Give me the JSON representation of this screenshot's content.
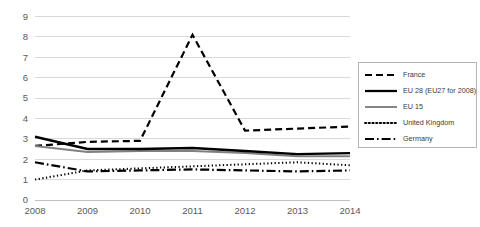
{
  "chart_data": {
    "type": "line",
    "title": "",
    "xlabel": "",
    "ylabel": "",
    "categories": [
      "2008",
      "2009",
      "2010",
      "2011",
      "2012",
      "2013",
      "2014"
    ],
    "x": [
      2008,
      2009,
      2010,
      2011,
      2012,
      2013,
      2014
    ],
    "ylim": [
      0,
      10
    ],
    "xlim": [
      2008,
      2014
    ],
    "grid": true,
    "gridlines": "horizontal",
    "legend_position": "right",
    "y_ticks": [
      "0",
      "1",
      "2",
      "3",
      "4",
      "5",
      "6",
      "7",
      "8",
      "9",
      "10"
    ],
    "y_tick_values": [
      0,
      1,
      2,
      3,
      4,
      5,
      6,
      7,
      8,
      9,
      10
    ],
    "x_ticks": [
      "2008",
      "2009",
      "2010",
      "2011",
      "2012",
      "2013",
      "2014"
    ],
    "series": [
      {
        "name": "France",
        "style": "dashed",
        "color": "#000000",
        "width": 2.2,
        "dash": "7,4",
        "values": [
          2.65,
          2.85,
          2.9,
          8.1,
          3.4,
          3.5,
          3.6
        ]
      },
      {
        "name": "EU 28 (EU27 for 2008)",
        "style": "solid",
        "color": "#000000",
        "width": 2.4,
        "dash": "",
        "values": [
          3.1,
          2.5,
          2.5,
          2.55,
          2.4,
          2.25,
          2.3
        ]
      },
      {
        "name": "EU 15",
        "style": "solid",
        "color": "#808080",
        "width": 2.0,
        "dash": "",
        "values": [
          2.65,
          2.35,
          2.4,
          2.4,
          2.3,
          2.15,
          2.15
        ]
      },
      {
        "name": "United Kingdom",
        "style": "dotted",
        "color": "#000000",
        "width": 2.0,
        "dash": "1.3,2.4",
        "values": [
          1.0,
          1.45,
          1.55,
          1.65,
          1.75,
          1.85,
          1.7
        ]
      },
      {
        "name": "Germany",
        "style": "dash-dot",
        "color": "#000000",
        "width": 2.2,
        "dash": "9,3,1.6,3",
        "values": [
          1.85,
          1.4,
          1.45,
          1.5,
          1.45,
          1.4,
          1.45
        ]
      }
    ]
  },
  "legend": {
    "items": [
      {
        "label": "France"
      },
      {
        "label": "EU 28 (EU27 for 2008)"
      },
      {
        "label": "EU 15"
      },
      {
        "label": "United Kingdom"
      },
      {
        "label": "Germany"
      }
    ]
  },
  "colors": {
    "grid": "#d9d9d9",
    "axis": "#bfbfbf",
    "tick_text": "#595959",
    "legend_border": "#b5b5b5",
    "background": "#ffffff"
  }
}
